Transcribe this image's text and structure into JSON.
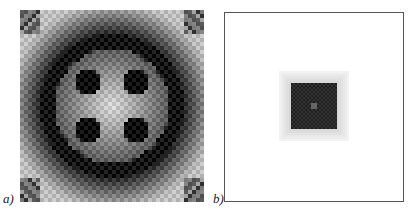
{
  "figure": {
    "panels": [
      {
        "label": "a)",
        "description": "radially symmetric grayscale pixel pattern with dark ring and four dark cross-shaped clusters near center",
        "grid_cells": 46
      },
      {
        "label": "b)",
        "description": "framed white field with a dark square blob at center",
        "grid_cells": 46
      }
    ],
    "colors": {
      "dark": "#111111",
      "light": "#f4f4f4",
      "frame": "#555555"
    }
  }
}
